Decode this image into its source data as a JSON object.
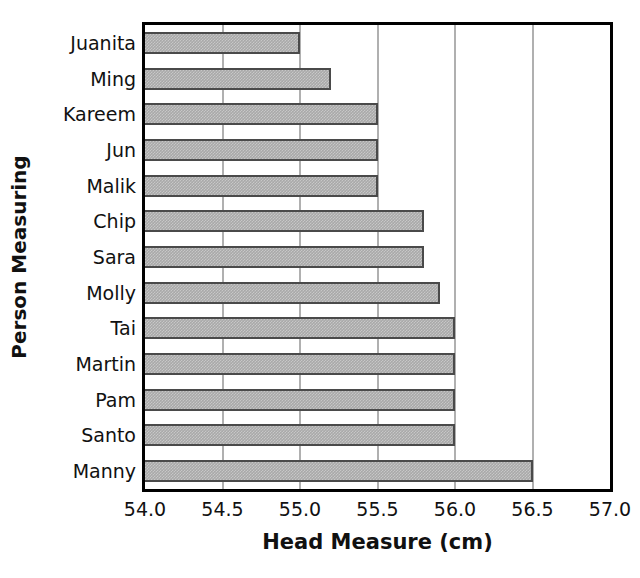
{
  "chart_data": {
    "type": "bar",
    "orientation": "horizontal",
    "title": "",
    "xlabel": "Head Measure (cm)",
    "ylabel": "Person Measuring",
    "categories": [
      "Juanita",
      "Ming",
      "Kareem",
      "Jun",
      "Malik",
      "Chip",
      "Sara",
      "Molly",
      "Tai",
      "Martin",
      "Pam",
      "Santo",
      "Manny"
    ],
    "values": [
      55.0,
      55.2,
      55.5,
      55.5,
      55.5,
      55.8,
      55.8,
      55.9,
      56.0,
      56.0,
      56.0,
      56.0,
      56.5
    ],
    "xlim": [
      54.0,
      57.0
    ],
    "xticks": [
      "54.0",
      "54.5",
      "55.0",
      "55.5",
      "56.0",
      "56.5",
      "57.0"
    ],
    "xtick_values": [
      54.0,
      54.5,
      55.0,
      55.5,
      56.0,
      56.5,
      57.0
    ],
    "grid": "vertical",
    "legend": "none",
    "bar_color": "#a9a9a9",
    "bar_edge_color": "#4a4a4a",
    "grid_color": "#b0b0b0",
    "axis_color": "#000000"
  },
  "axes": {
    "x_title": "Head Measure (cm)",
    "y_title": "Person Measuring"
  }
}
